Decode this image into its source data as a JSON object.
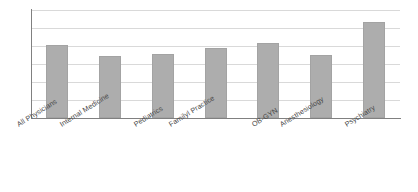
{
  "chart_data": {
    "type": "bar",
    "title": "",
    "subtitle": "",
    "xlabel": "",
    "ylabel": "",
    "categories": [
      "All Physicians",
      "Internal Medicine",
      "Pediatrics",
      "Familyl Practice",
      "OB-GYN",
      "Anesthesiology",
      "Psychiatry"
    ],
    "values": [
      68,
      57,
      59,
      65,
      69,
      58,
      89
    ],
    "ylim": [
      0,
      100
    ],
    "grid": true,
    "gridline_count": 6,
    "legend": "none",
    "axis_labels_visible": false,
    "tick_labels_y": [],
    "bar_color": "#adadad",
    "gridline_color": "#d9d9d9",
    "axis_color": "#808080",
    "background_color": "#ffffff",
    "label_rotation_deg": -32
  },
  "accessibility": {
    "chart_region_name": "bar-chart"
  }
}
